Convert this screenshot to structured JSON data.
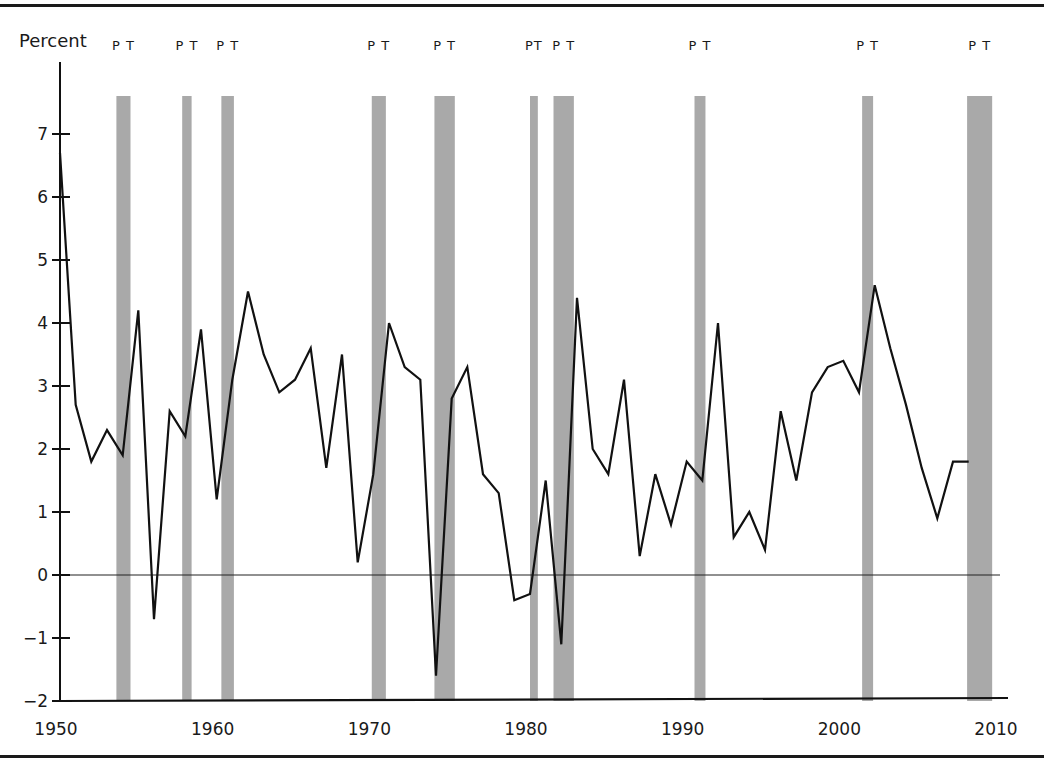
{
  "chart_data": {
    "type": "line",
    "title": "",
    "xlabel": "",
    "ylabel": "Percent",
    "xlim": [
      1950,
      2010
    ],
    "ylim": [
      -2,
      7.7
    ],
    "grid": false,
    "legend": null,
    "x_ticks": [
      1950,
      1960,
      1970,
      1980,
      1990,
      2000,
      2010
    ],
    "y_ticks": [
      -2,
      -1,
      0,
      1,
      2,
      3,
      4,
      5,
      6,
      7
    ],
    "zero_line": true,
    "series": [
      {
        "name": "Percent",
        "color": "#111111",
        "x": [
          1950,
          1951,
          1952,
          1953,
          1954,
          1955,
          1956,
          1957,
          1958,
          1959,
          1960,
          1961,
          1962,
          1963,
          1964,
          1965,
          1966,
          1967,
          1968,
          1969,
          1970,
          1971,
          1972,
          1973,
          1974,
          1975,
          1976,
          1977,
          1978,
          1979,
          1980,
          1981,
          1982,
          1983,
          1984,
          1985,
          1986,
          1987,
          1988,
          1989,
          1990,
          1991,
          1992,
          1993,
          1994,
          1995,
          1996,
          1997,
          1998,
          1999,
          2000,
          2001,
          2002,
          2003,
          2004,
          2005,
          2006,
          2007,
          2008
        ],
        "values": [
          6.7,
          2.7,
          1.8,
          2.3,
          1.9,
          4.2,
          -0.7,
          2.6,
          2.2,
          3.9,
          1.2,
          3.1,
          4.5,
          3.5,
          2.9,
          3.1,
          3.6,
          1.7,
          3.5,
          0.2,
          1.6,
          4.0,
          3.3,
          3.1,
          -1.6,
          2.8,
          3.3,
          1.6,
          1.3,
          -0.4,
          -0.3,
          1.5,
          -1.1,
          4.4,
          2.0,
          1.6,
          3.1,
          0.3,
          1.6,
          0.8,
          1.8,
          1.5,
          4.0,
          0.6,
          1.0,
          0.4,
          2.6,
          1.5,
          2.9,
          3.3,
          3.4,
          2.9,
          4.6,
          3.6,
          2.7,
          1.7,
          0.9,
          1.8,
          1.8
        ]
      }
    ],
    "recessions": [
      {
        "label": "P T",
        "start": 1953.6,
        "end": 1954.5
      },
      {
        "label": "P T",
        "start": 1957.8,
        "end": 1958.4
      },
      {
        "label": "P T",
        "start": 1960.3,
        "end": 1961.1
      },
      {
        "label": "P T",
        "start": 1969.9,
        "end": 1970.8
      },
      {
        "label": "P T",
        "start": 1973.9,
        "end": 1975.2
      },
      {
        "label": "PT",
        "start": 1980.0,
        "end": 1980.5
      },
      {
        "label": "P T",
        "start": 1981.5,
        "end": 1982.8
      },
      {
        "label": "P T",
        "start": 1990.5,
        "end": 1991.2
      },
      {
        "label": "P T",
        "start": 2001.2,
        "end": 2001.9
      },
      {
        "label": "P T",
        "start": 2007.9,
        "end": 2009.5
      }
    ],
    "annotations": [
      "P = peak",
      "T = trough"
    ]
  },
  "labels": {
    "y_axis_title": "Percent"
  },
  "style": {
    "line_color": "#111111",
    "recession_color": "#a9a9a9",
    "axis_color": "#111111"
  }
}
